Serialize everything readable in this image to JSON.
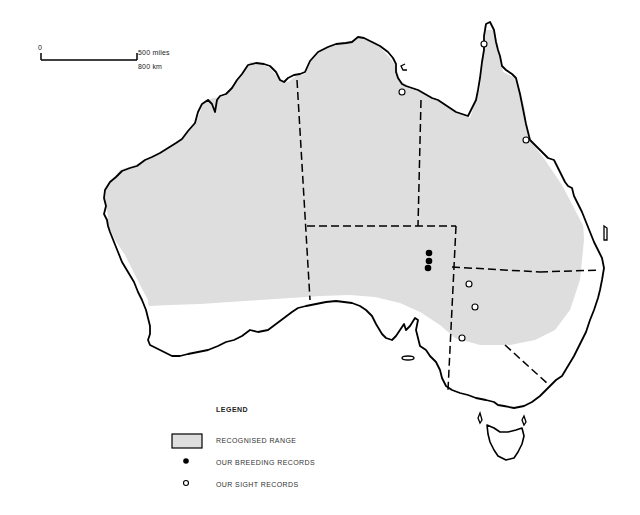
{
  "scale_bar": {
    "start_label": "0",
    "miles_label": "500 miles",
    "km_label": "800 km"
  },
  "legend": {
    "title": "LEGEND",
    "items": [
      {
        "symbol": "gray-filled-rectangle",
        "label": "RECOGNISED RANGE"
      },
      {
        "symbol": "filled-black-dot",
        "label": "OUR BREEDING RECORDS"
      },
      {
        "symbol": "open-circle",
        "label": "OUR SIGHT RECORDS"
      }
    ]
  },
  "colors": {
    "range_fill": "#dedede",
    "outline": "#000000",
    "background": "#ffffff"
  },
  "records": {
    "breeding": [
      {
        "x": 429,
        "y": 253
      },
      {
        "x": 429,
        "y": 261
      },
      {
        "x": 428,
        "y": 268
      }
    ],
    "sight": [
      {
        "x": 484,
        "y": 44
      },
      {
        "x": 402,
        "y": 92
      },
      {
        "x": 526,
        "y": 140
      },
      {
        "x": 469,
        "y": 284
      },
      {
        "x": 475,
        "y": 307
      },
      {
        "x": 462,
        "y": 338
      }
    ]
  }
}
